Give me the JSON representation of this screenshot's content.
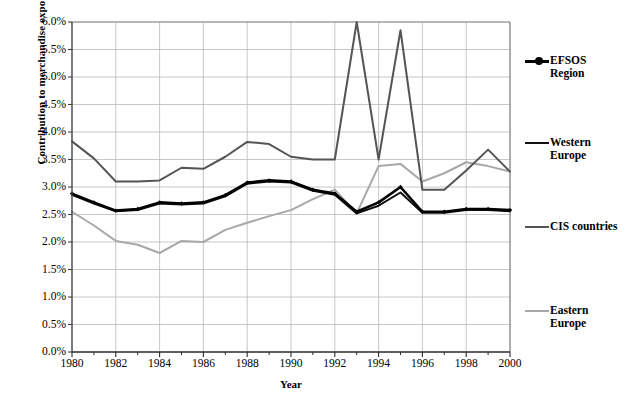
{
  "chart_data": {
    "type": "line",
    "title": "",
    "xlabel": "Year",
    "ylabel": "Contribution to merchandise exports",
    "x": [
      1980,
      1981,
      1982,
      1983,
      1984,
      1985,
      1986,
      1987,
      1988,
      1989,
      1990,
      1991,
      1992,
      1993,
      1994,
      1995,
      1996,
      1997,
      1998,
      1999,
      2000
    ],
    "xlim": [
      1980,
      2000
    ],
    "ylim": [
      0.0,
      6.0
    ],
    "ytick_step": 0.5,
    "yticks": [
      "0.0%",
      "0.5%",
      "1.0%",
      "1.5%",
      "2.0%",
      "2.5%",
      "3.0%",
      "3.5%",
      "4.0%",
      "4.5%",
      "5.0%",
      "5.5%",
      "6.0%"
    ],
    "ytick_values": [
      0.0,
      0.5,
      1.0,
      1.5,
      2.0,
      2.5,
      3.0,
      3.5,
      4.0,
      4.5,
      5.0,
      5.5,
      6.0
    ],
    "xticks": [
      "1980",
      "1982",
      "1984",
      "1986",
      "1988",
      "1990",
      "1992",
      "1994",
      "1996",
      "1998",
      "2000"
    ],
    "xtick_values": [
      1980,
      1982,
      1984,
      1986,
      1988,
      1990,
      1992,
      1994,
      1996,
      1998,
      2000
    ],
    "minor_xticks": [
      1981,
      1983,
      1985,
      1987,
      1989,
      1991,
      1993,
      1995,
      1997,
      1999
    ],
    "grid": true,
    "legend_position": "right",
    "units": "percent",
    "series": [
      {
        "name": "EFSOS Region",
        "color": "#000000",
        "width": 2.6,
        "marker": "diamond",
        "values": [
          2.88,
          2.72,
          2.57,
          2.6,
          2.72,
          2.7,
          2.72,
          2.85,
          3.08,
          3.12,
          3.1,
          2.95,
          2.88,
          2.55,
          2.72,
          3.0,
          2.55,
          2.55,
          2.6,
          2.6,
          2.58
        ]
      },
      {
        "name": "Western Europe",
        "color": "#111111",
        "width": 2.0,
        "marker": "none",
        "values": [
          2.86,
          2.7,
          2.56,
          2.58,
          2.7,
          2.68,
          2.7,
          2.83,
          3.06,
          3.1,
          3.08,
          2.93,
          2.86,
          2.52,
          2.66,
          2.9,
          2.53,
          2.53,
          2.58,
          2.58,
          2.56
        ]
      },
      {
        "name": "CIS countries",
        "color": "#555555",
        "width": 2.0,
        "marker": "none",
        "values": [
          3.83,
          3.52,
          3.1,
          3.1,
          3.12,
          3.35,
          3.33,
          3.55,
          3.82,
          3.78,
          3.55,
          3.5,
          3.5,
          6.0,
          3.5,
          5.85,
          2.95,
          2.95,
          3.3,
          3.68,
          3.28
        ]
      },
      {
        "name": "Eastern Europe",
        "color": "#a8a8a8",
        "width": 2.0,
        "marker": "none",
        "values": [
          2.55,
          2.3,
          2.02,
          1.95,
          1.8,
          2.02,
          2.0,
          2.22,
          2.35,
          2.47,
          2.58,
          2.78,
          2.95,
          2.52,
          3.38,
          3.42,
          3.1,
          3.25,
          3.45,
          3.38,
          3.28
        ]
      }
    ]
  },
  "legend": {
    "entries": [
      {
        "label": "EFSOS\nRegion",
        "color": "#000000",
        "marker": true
      },
      {
        "label": "Western\nEurope",
        "color": "#111111",
        "marker": false
      },
      {
        "label": "CIS countries",
        "color": "#555555",
        "marker": false
      },
      {
        "label": "Eastern\nEurope",
        "color": "#a8a8a8",
        "marker": false
      }
    ]
  }
}
